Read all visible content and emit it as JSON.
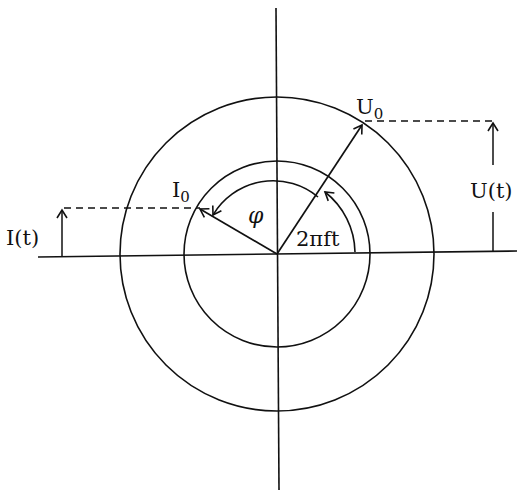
{
  "diagram": {
    "type": "phasor-diagram",
    "labels": {
      "voltage_amplitude": "U",
      "voltage_amplitude_sub": "0",
      "current_amplitude": "I",
      "current_amplitude_sub": "0",
      "voltage_instant": "U(t)",
      "current_instant": "I(t)",
      "phase_shift": "φ",
      "rotation_angle": "2πft"
    },
    "colors": {
      "stroke": "#111111",
      "background": "#ffffff"
    }
  }
}
